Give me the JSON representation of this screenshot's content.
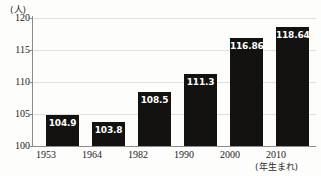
{
  "chart_data": {
    "type": "bar",
    "title": "",
    "xlabel": "(年生まれ)",
    "ylabel": "(人)",
    "categories": [
      "1953",
      "1964",
      "1982",
      "1990",
      "2000",
      "2010"
    ],
    "values": [
      104.9,
      103.8,
      108.5,
      111.3,
      116.86,
      118.64
    ],
    "value_labels": [
      "104.9",
      "103.8",
      "108.5",
      "111.3",
      "116.86",
      "118.64"
    ],
    "ylim": [
      100,
      120
    ],
    "yticks": [
      100,
      105,
      110,
      115,
      120
    ],
    "ytick_labels": [
      "100",
      "105",
      "110",
      "115",
      "120"
    ],
    "grid": true,
    "legend": null,
    "bar_color": "#141210",
    "value_label_color": "#ffffff",
    "gridline_color": "#dedede",
    "axis_color": "#8c8c8c",
    "background_color": "#fdfdfb"
  }
}
